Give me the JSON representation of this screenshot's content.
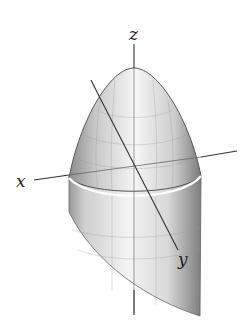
{
  "figure": {
    "axes": {
      "x_label": "x",
      "y_label": "y",
      "z_label": "z"
    },
    "colors": {
      "surface_light": "#f2f2f2",
      "surface_dark": "#8a8a8a",
      "outline": "#555555",
      "axis": "#333333",
      "rim": "#ffffff"
    }
  }
}
